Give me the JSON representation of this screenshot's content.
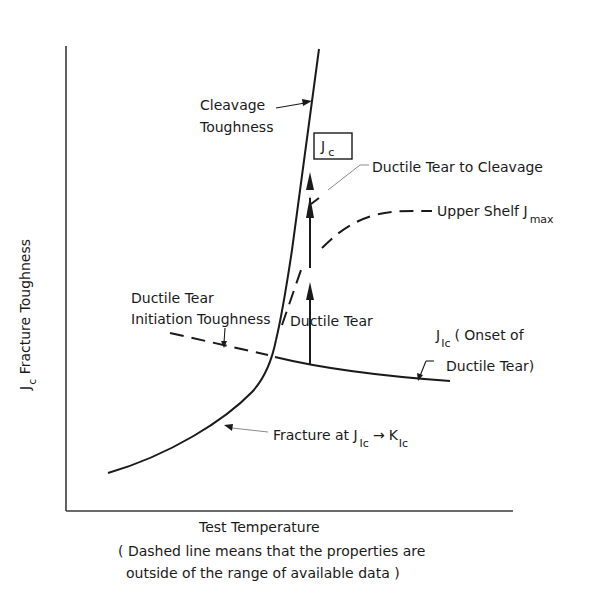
{
  "diagram": {
    "type": "schematic-curve",
    "axes": {
      "y_label_main": "J",
      "y_label_sub": "c",
      "y_label_rest": " Fracture Toughness",
      "x_label": "Test Temperature"
    },
    "caption": {
      "line1": "( Dashed line means that the properties are",
      "line2": "outside of the range of available data )"
    },
    "labels": {
      "cleavage_1": "Cleavage",
      "cleavage_2": "Toughness",
      "jc_box_main": "J",
      "jc_box_sub": "c",
      "tear_to_cleavage": "Ductile Tear to Cleavage",
      "upper_shelf": "Upper Shelf J",
      "upper_shelf_sub": "max",
      "initiation_1": "Ductile Tear",
      "initiation_2": "Initiation Toughness",
      "ductile_tear": "Ductile Tear",
      "jic_main": "J",
      "jic_sub": "Ic",
      "jic_text_1": "( Onset of",
      "jic_text_2": "Ductile Tear)",
      "fracture_prefix": "Fracture at J",
      "fracture_sub1": "Ic",
      "fracture_arrow": "→",
      "fracture_k": "K",
      "fracture_sub2": "Ic"
    },
    "curves": [
      {
        "name": "lower-transition-curve",
        "style": "solid"
      },
      {
        "name": "cleavage-toughness-line",
        "style": "solid"
      },
      {
        "name": "jic-onset-line",
        "style": "solid"
      },
      {
        "name": "initiation-toughness-dashed",
        "style": "dashed"
      },
      {
        "name": "upper-shelf-dashed",
        "style": "dashed"
      },
      {
        "name": "ductile-tear-arrow",
        "style": "solid-arrow"
      }
    ],
    "colors": {
      "line": "#1a1a1a",
      "axis": "#3a3a3a",
      "background": "#ffffff"
    }
  }
}
